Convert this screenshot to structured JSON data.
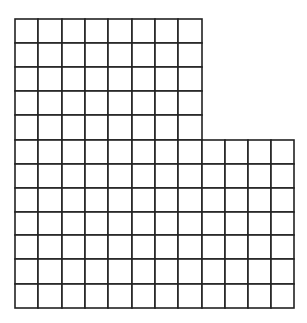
{
  "diagram": {
    "type": "grid-shape",
    "line_color": "#222222",
    "background": "#ffffff",
    "cell_size_px": 23.3,
    "origin": [
      15,
      19
    ],
    "total_columns": 12,
    "total_rows": 12,
    "blocks": [
      {
        "name": "upper-block",
        "col_start": 0,
        "columns": 8,
        "row_start": 0,
        "rows": 5
      },
      {
        "name": "lower-block",
        "col_start": 0,
        "columns": 12,
        "row_start": 5,
        "rows": 7
      }
    ],
    "square_count": 124
  }
}
